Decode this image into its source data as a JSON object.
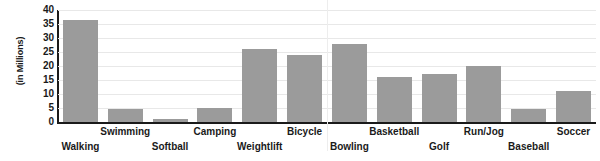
{
  "chart_data": {
    "type": "bar",
    "title": "",
    "xlabel": "",
    "ylabel": "(in Millions)",
    "ylim": [
      0,
      40
    ],
    "yticks": [
      0,
      5,
      10,
      15,
      20,
      25,
      30,
      35,
      40
    ],
    "grid": true,
    "legend": false,
    "bar_color": "#9b9b9b",
    "axis_color": "#1a1a1a",
    "gridline_color": "#e8e8e8",
    "categories": [
      "Walking",
      "Swimming",
      "Softball",
      "Camping",
      "Weightlift",
      "Bicycle",
      "Bowling",
      "Basketball",
      "Golf",
      "Run/Jog",
      "Baseball",
      "Soccer"
    ],
    "values": [
      36.5,
      4.5,
      1,
      5,
      26,
      24,
      28,
      16,
      17,
      20,
      4.5,
      11
    ],
    "label_rows": [
      "bottom",
      "top",
      "bottom",
      "top",
      "bottom",
      "top",
      "bottom",
      "top",
      "bottom",
      "top",
      "bottom",
      "top"
    ]
  }
}
